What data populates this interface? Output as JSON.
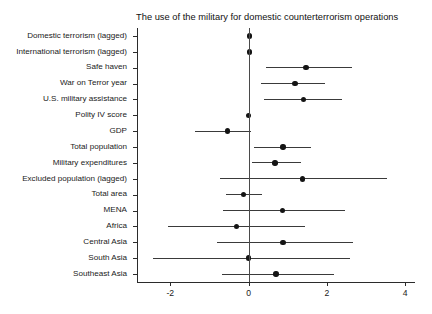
{
  "chart_data": {
    "type": "scatter",
    "subtype": "coefficient-plot-with-error-bars",
    "title": "The use of the military for domestic counterterrorism operations",
    "xlabel": "",
    "ylabel": "",
    "xlim": [
      -2.85,
      4.25
    ],
    "xticks": [
      -2,
      0,
      2,
      4
    ],
    "xtick_labels": [
      "-2",
      "0",
      "2",
      "4"
    ],
    "grid": false,
    "legend": null,
    "reference_line": 0,
    "categories": [
      "Domestic terrorism (lagged)",
      "International terrorism (lagged)",
      "Safe haven",
      "War on Terror year",
      "U.S. military assistance",
      "Polity IV score",
      "GDP",
      "Total population",
      "Military expenditures",
      "Excluded population (lagged)",
      "Total area",
      "MENA",
      "Africa",
      "Central Asia",
      "South Asia",
      "Southeast Asia"
    ],
    "values": [
      0.03,
      0.02,
      1.47,
      1.19,
      1.4,
      0.0,
      -0.54,
      0.88,
      0.67,
      1.37,
      -0.13,
      0.87,
      -0.31,
      0.88,
      0.0,
      0.7
    ],
    "ci_low": [
      -0.02,
      -0.03,
      0.44,
      0.31,
      0.39,
      -0.04,
      -1.37,
      0.13,
      0.08,
      -0.72,
      -0.57,
      -0.65,
      -2.07,
      -0.8,
      -2.45,
      -0.67
    ],
    "ci_high": [
      0.08,
      0.07,
      2.64,
      1.94,
      2.38,
      0.04,
      0.05,
      1.6,
      1.34,
      3.54,
      0.34,
      2.45,
      1.45,
      2.66,
      2.58,
      2.17
    ],
    "points": [
      {
        "label": "Domestic terrorism (lagged)",
        "estimate": 0.03,
        "ci_low": -0.02,
        "ci_high": 0.08
      },
      {
        "label": "International terrorism (lagged)",
        "estimate": 0.02,
        "ci_low": -0.03,
        "ci_high": 0.07
      },
      {
        "label": "Safe haven",
        "estimate": 1.47,
        "ci_low": 0.44,
        "ci_high": 2.64
      },
      {
        "label": "War on Terror year",
        "estimate": 1.19,
        "ci_low": 0.31,
        "ci_high": 1.94
      },
      {
        "label": "U.S. military assistance",
        "estimate": 1.4,
        "ci_low": 0.39,
        "ci_high": 2.38
      },
      {
        "label": "Polity IV score",
        "estimate": 0.0,
        "ci_low": -0.04,
        "ci_high": 0.04
      },
      {
        "label": "GDP",
        "estimate": -0.54,
        "ci_low": -1.37,
        "ci_high": 0.05
      },
      {
        "label": "Total population",
        "estimate": 0.88,
        "ci_low": 0.13,
        "ci_high": 1.6
      },
      {
        "label": "Military expenditures",
        "estimate": 0.67,
        "ci_low": 0.08,
        "ci_high": 1.34
      },
      {
        "label": "Excluded population (lagged)",
        "estimate": 1.37,
        "ci_low": -0.72,
        "ci_high": 3.54
      },
      {
        "label": "Total area",
        "estimate": -0.13,
        "ci_low": -0.57,
        "ci_high": 0.34
      },
      {
        "label": "MENA",
        "estimate": 0.87,
        "ci_low": -0.65,
        "ci_high": 2.45
      },
      {
        "label": "Africa",
        "estimate": -0.31,
        "ci_low": -2.07,
        "ci_high": 1.45
      },
      {
        "label": "Central Asia",
        "estimate": 0.88,
        "ci_low": -0.8,
        "ci_high": 2.66
      },
      {
        "label": "South Asia",
        "estimate": 0.0,
        "ci_low": -2.45,
        "ci_high": 2.58
      },
      {
        "label": "Southeast Asia",
        "estimate": 0.7,
        "ci_low": -0.67,
        "ci_high": 2.17
      }
    ],
    "colors": {
      "point": "#141414",
      "ci": "#3a3a3a",
      "axis": "#2b2b2b",
      "reference": "#4a4a4a",
      "background": "#ffffff",
      "text": "#1a1a1a"
    }
  }
}
